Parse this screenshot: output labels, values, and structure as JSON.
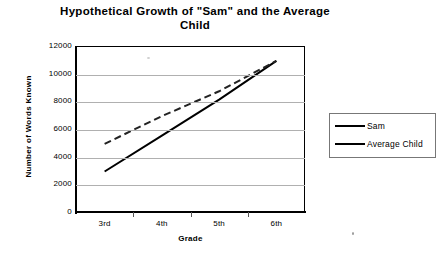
{
  "chart_data": {
    "type": "line",
    "title": "Hypothetical Growth of \"Sam\" and the Average Child",
    "title_line1": "Hypothetical Growth of \"Sam\" and the Average",
    "title_line2": "Child",
    "xlabel": "Grade",
    "ylabel": "Number of Words Known",
    "categories": [
      "3rd",
      "4th",
      "5th",
      "6th"
    ],
    "ylim": [
      0,
      12000
    ],
    "yticks": [
      12000,
      10000,
      8000,
      6000,
      4000,
      2000,
      0
    ],
    "ytick_labels": [
      "12000",
      "10000",
      "8000",
      "6000",
      "4000",
      "2000",
      "0"
    ],
    "grid": true,
    "legend_position": "right",
    "series": [
      {
        "name": "Sam",
        "values": [
          3000,
          5600,
          8200,
          11000
        ],
        "color": "#111111",
        "marker": "square",
        "linestyle": "solid"
      },
      {
        "name": "Average Child",
        "values": [
          5000,
          7000,
          8800,
          11000
        ],
        "color": "#8a8a8a",
        "marker": "diamond",
        "linestyle": "dashed"
      }
    ]
  },
  "legend": {
    "entries": [
      {
        "label": "Sam"
      },
      {
        "label": "Average Child"
      }
    ]
  }
}
